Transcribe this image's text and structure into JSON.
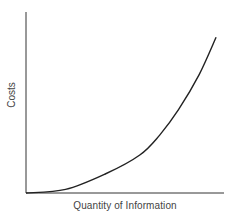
{
  "chart_data": {
    "type": "line",
    "title": "",
    "xlabel": "Quantity of Information",
    "ylabel": "Costs",
    "xlim": [
      0,
      1
    ],
    "ylim": [
      0,
      1
    ],
    "grid": false,
    "legend": null,
    "ticks": "none",
    "series": [
      {
        "name": "Costs",
        "color": "#222222",
        "x": [
          0.0,
          0.2,
          0.4,
          0.575,
          0.675,
          0.77,
          0.875,
          0.96
        ],
        "y": [
          0.0,
          0.02,
          0.105,
          0.21,
          0.32,
          0.46,
          0.655,
          0.86
        ]
      }
    ]
  }
}
